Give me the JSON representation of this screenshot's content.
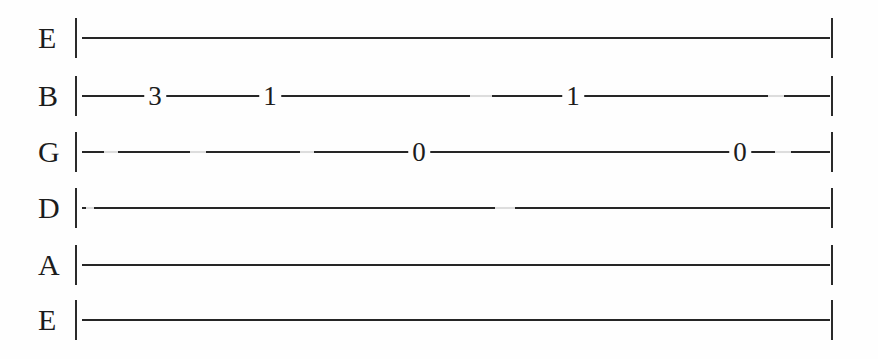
{
  "document": {
    "title": "Guitar Tablature",
    "notation_type": "guitar-tab",
    "background_color": "#fefefe",
    "ink_color": "#262626"
  },
  "tab": {
    "string_count": 6,
    "barline_left_label": "|",
    "barline_right_label": "|",
    "strings": [
      {
        "label": "E",
        "string_number": 1,
        "top": 10,
        "notes": []
      },
      {
        "label": "B",
        "string_number": 2,
        "top": 68,
        "notes": [
          {
            "fret": "3",
            "x": 155
          },
          {
            "fret": "1",
            "x": 270
          },
          {
            "fret": "1",
            "x": 573
          }
        ]
      },
      {
        "label": "G",
        "string_number": 3,
        "top": 124,
        "notes": [
          {
            "fret": "0",
            "x": 419
          },
          {
            "fret": "0",
            "x": 740
          }
        ]
      },
      {
        "label": "D",
        "string_number": 4,
        "top": 180,
        "notes": []
      },
      {
        "label": "A",
        "string_number": 5,
        "top": 237,
        "notes": []
      },
      {
        "label": "E",
        "string_number": 6,
        "top": 292,
        "notes": []
      }
    ]
  }
}
